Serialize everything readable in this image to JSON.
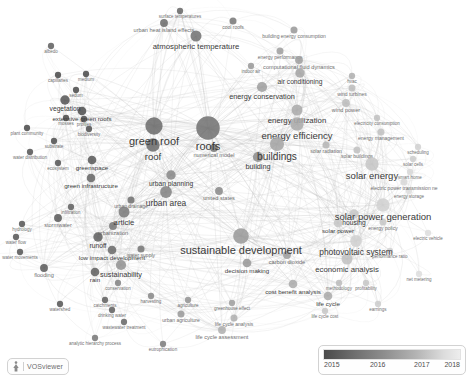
{
  "app": {
    "name": "VOSviewer",
    "logo_mark": "vosviewer-mark"
  },
  "legend": {
    "title": "year-overlay-scale",
    "ticks": [
      "2015",
      "2016",
      "2017",
      "2018"
    ],
    "color_start": "#4a4a4a",
    "color_end": "#ededed"
  },
  "chart_data": {
    "type": "network",
    "title": "",
    "colormap": "grayscale-by-average-publication-year",
    "color_range": [
      2015,
      2018
    ],
    "nodes": [
      {
        "label": "roofs",
        "x": 208,
        "y": 128,
        "size": 30,
        "year": 2015.9
      },
      {
        "label": "green roof",
        "x": 154,
        "y": 126,
        "size": 22,
        "year": 2015.8
      },
      {
        "label": "roof",
        "x": 153,
        "y": 145,
        "size": 17,
        "year": 2015.8
      },
      {
        "label": "buildings",
        "x": 277,
        "y": 144,
        "size": 18,
        "year": 2016.8
      },
      {
        "label": "building",
        "x": 258,
        "y": 157,
        "size": 13,
        "year": 2016.4
      },
      {
        "label": "sustainable development",
        "x": 241,
        "y": 236,
        "size": 20,
        "year": 2016.6
      },
      {
        "label": "energy efficiency",
        "x": 297,
        "y": 124,
        "size": 17,
        "year": 2016.9
      },
      {
        "label": "energy utilization",
        "x": 297,
        "y": 110,
        "size": 14,
        "year": 2016.9
      },
      {
        "label": "solar energy",
        "x": 372,
        "y": 164,
        "size": 17,
        "year": 2017.4
      },
      {
        "label": "solar power generation",
        "x": 383,
        "y": 205,
        "size": 17,
        "year": 2017.6
      },
      {
        "label": "photovoltaic system",
        "x": 356,
        "y": 241,
        "size": 15,
        "year": 2017.6
      },
      {
        "label": "economic analysis",
        "x": 347,
        "y": 259,
        "size": 14,
        "year": 2017.3
      },
      {
        "label": "urban area",
        "x": 166,
        "y": 192,
        "size": 15,
        "year": 2016.2
      },
      {
        "label": "urban planning",
        "x": 171,
        "y": 175,
        "size": 12,
        "year": 2016.3
      },
      {
        "label": "article",
        "x": 124,
        "y": 212,
        "size": 14,
        "year": 2016.1
      },
      {
        "label": "atmospheric temperature",
        "x": 196,
        "y": 36,
        "size": 14,
        "year": 2015.9
      },
      {
        "label": "sustainability",
        "x": 121,
        "y": 265,
        "size": 13,
        "year": 2016.5
      },
      {
        "label": "runoff",
        "x": 98,
        "y": 237,
        "size": 12,
        "year": 2015.6
      },
      {
        "label": "low impact development",
        "x": 112,
        "y": 250,
        "size": 11,
        "year": 2015.8
      },
      {
        "label": "rain",
        "x": 95,
        "y": 272,
        "size": 11,
        "year": 2015.6
      },
      {
        "label": "vegetation",
        "x": 65,
        "y": 100,
        "size": 12,
        "year": 2015.4
      },
      {
        "label": "extensive green roofs",
        "x": 82,
        "y": 111,
        "size": 11,
        "year": 2015.3
      },
      {
        "label": "greenspace",
        "x": 92,
        "y": 160,
        "size": 11,
        "year": 2015.5
      },
      {
        "label": "green infrastructure",
        "x": 91,
        "y": 178,
        "size": 11,
        "year": 2015.7
      },
      {
        "label": "housing",
        "x": 354,
        "y": 214,
        "size": 12,
        "year": 2017.4
      },
      {
        "label": "solar power",
        "x": 338,
        "y": 223,
        "size": 11,
        "year": 2017.4
      },
      {
        "label": "cost benefit analysis",
        "x": 293,
        "y": 284,
        "size": 11,
        "year": 2016.9
      },
      {
        "label": "decision making",
        "x": 247,
        "y": 263,
        "size": 11,
        "year": 2016.6
      },
      {
        "label": "life cycle",
        "x": 328,
        "y": 296,
        "size": 11,
        "year": 2016.9
      },
      {
        "label": "air conditioning",
        "x": 300,
        "y": 73,
        "size": 12,
        "year": 2016.8
      },
      {
        "label": "energy conservation",
        "x": 262,
        "y": 87,
        "size": 13,
        "year": 2016.7
      },
      {
        "label": "numerical model",
        "x": 214,
        "y": 148,
        "size": 10,
        "year": 2016.0
      },
      {
        "label": "urbanization",
        "x": 113,
        "y": 226,
        "size": 10,
        "year": 2016.0
      },
      {
        "label": "stormwater",
        "x": 58,
        "y": 218,
        "size": 10,
        "year": 2015.5
      },
      {
        "label": "flooding",
        "x": 44,
        "y": 268,
        "size": 10,
        "year": 2015.5
      },
      {
        "label": "watershed",
        "x": 60,
        "y": 304,
        "size": 8,
        "year": 2015.4
      },
      {
        "label": "catchments",
        "x": 105,
        "y": 300,
        "size": 8,
        "year": 2015.6
      },
      {
        "label": "drinking water",
        "x": 112,
        "y": 310,
        "size": 8,
        "year": 2015.6
      },
      {
        "label": "wastewater treatment",
        "x": 124,
        "y": 322,
        "size": 8,
        "year": 2015.7
      },
      {
        "label": "analytic hierarchy process",
        "x": 95,
        "y": 338,
        "size": 8,
        "year": 2016.0
      },
      {
        "label": "eutrophication",
        "x": 163,
        "y": 344,
        "size": 8,
        "year": 2016.1
      },
      {
        "label": "life cycle assessment",
        "x": 222,
        "y": 330,
        "size": 10,
        "year": 2017.0
      },
      {
        "label": "life cycle analysis",
        "x": 234,
        "y": 318,
        "size": 9,
        "year": 2017.0
      },
      {
        "label": "urban agriculture",
        "x": 181,
        "y": 314,
        "size": 9,
        "year": 2016.6
      },
      {
        "label": "agriculture",
        "x": 188,
        "y": 300,
        "size": 8,
        "year": 2016.5
      },
      {
        "label": "harvesting",
        "x": 151,
        "y": 296,
        "size": 8,
        "year": 2016.3
      },
      {
        "label": "conservation",
        "x": 118,
        "y": 283,
        "size": 8,
        "year": 2016.2
      },
      {
        "label": "greenhouse effect",
        "x": 232,
        "y": 303,
        "size": 8,
        "year": 2016.7
      },
      {
        "label": "carbon dioxide",
        "x": 287,
        "y": 255,
        "size": 10,
        "year": 2016.7
      },
      {
        "label": "surface temperatures",
        "x": 180,
        "y": 11,
        "size": 8,
        "year": 2015.7
      },
      {
        "label": "urban heat island effects",
        "x": 164,
        "y": 23,
        "size": 10,
        "year": 2015.8
      },
      {
        "label": "cool roofs",
        "x": 233,
        "y": 21,
        "size": 9,
        "year": 2016.0
      },
      {
        "label": "albedo",
        "x": 51,
        "y": 46,
        "size": 8,
        "year": 2015.6
      },
      {
        "label": "building energy consumption",
        "x": 294,
        "y": 30,
        "size": 9,
        "year": 2016.6
      },
      {
        "label": "energy performance",
        "x": 280,
        "y": 51,
        "size": 9,
        "year": 2016.7
      },
      {
        "label": "computational fluid dynamics",
        "x": 299,
        "y": 60,
        "size": 10,
        "year": 2016.7
      },
      {
        "label": "hvac",
        "x": 352,
        "y": 76,
        "size": 8,
        "year": 2017.0
      },
      {
        "label": "wind turbines",
        "x": 352,
        "y": 88,
        "size": 9,
        "year": 2017.2
      },
      {
        "label": "wind power",
        "x": 346,
        "y": 103,
        "size": 10,
        "year": 2017.2
      },
      {
        "label": "electricity consumption",
        "x": 377,
        "y": 118,
        "size": 8,
        "year": 2017.3
      },
      {
        "label": "energy management",
        "x": 381,
        "y": 132,
        "size": 9,
        "year": 2017.3
      },
      {
        "label": "solar buildings",
        "x": 357,
        "y": 150,
        "size": 9,
        "year": 2017.3
      },
      {
        "label": "scheduling",
        "x": 418,
        "y": 147,
        "size": 8,
        "year": 2017.6
      },
      {
        "label": "solar cells",
        "x": 413,
        "y": 159,
        "size": 8,
        "year": 2017.5
      },
      {
        "label": "smart home",
        "x": 410,
        "y": 172,
        "size": 8,
        "year": 2017.7
      },
      {
        "label": "electric power transmission ne",
        "x": 404,
        "y": 182,
        "size": 9,
        "year": 2017.7
      },
      {
        "label": "energy storage",
        "x": 409,
        "y": 191,
        "size": 8,
        "year": 2017.8
      },
      {
        "label": "energy policy",
        "x": 383,
        "y": 222,
        "size": 9,
        "year": 2017.4
      },
      {
        "label": "electric vehicle",
        "x": 428,
        "y": 233,
        "size": 8,
        "year": 2017.8
      },
      {
        "label": "performance ratio",
        "x": 390,
        "y": 251,
        "size": 8,
        "year": 2017.6
      },
      {
        "label": "net metering",
        "x": 419,
        "y": 274,
        "size": 8,
        "year": 2017.8
      },
      {
        "label": "profitability",
        "x": 366,
        "y": 283,
        "size": 8,
        "year": 2017.4
      },
      {
        "label": "methodology",
        "x": 339,
        "y": 283,
        "size": 8,
        "year": 2017.2
      },
      {
        "label": "earnings",
        "x": 378,
        "y": 304,
        "size": 8,
        "year": 2017.5
      },
      {
        "label": "life cycle cost",
        "x": 325,
        "y": 311,
        "size": 8,
        "year": 2017.4
      },
      {
        "label": "united states",
        "x": 219,
        "y": 191,
        "size": 10,
        "year": 2016.3
      },
      {
        "label": "plant community",
        "x": 27,
        "y": 128,
        "size": 8,
        "year": 2015.2
      },
      {
        "label": "water distribution",
        "x": 30,
        "y": 152,
        "size": 8,
        "year": 2015.4
      },
      {
        "label": "capillaries",
        "x": 58,
        "y": 75,
        "size": 8,
        "year": 2015.2
      },
      {
        "label": "medium",
        "x": 86,
        "y": 74,
        "size": 8,
        "year": 2015.2
      },
      {
        "label": "sedum",
        "x": 76,
        "y": 90,
        "size": 8,
        "year": 2015.2
      },
      {
        "label": "substrate",
        "x": 54,
        "y": 141,
        "size": 8,
        "year": 2015.3
      },
      {
        "label": "biodiversity",
        "x": 89,
        "y": 129,
        "size": 8,
        "year": 2015.3
      },
      {
        "label": "ecosystem",
        "x": 58,
        "y": 163,
        "size": 8,
        "year": 2015.4
      },
      {
        "label": "hydrology",
        "x": 22,
        "y": 224,
        "size": 8,
        "year": 2015.4
      },
      {
        "label": "water flow",
        "x": 16,
        "y": 237,
        "size": 8,
        "year": 2015.4
      },
      {
        "label": "water movements",
        "x": 20,
        "y": 252,
        "size": 8,
        "year": 2015.4
      },
      {
        "label": "water supply",
        "x": 141,
        "y": 249,
        "size": 9,
        "year": 2016.0
      },
      {
        "label": "urban drainage",
        "x": 131,
        "y": 200,
        "size": 9,
        "year": 2015.9
      },
      {
        "label": "infiltration",
        "x": 71,
        "y": 207,
        "size": 8,
        "year": 2015.6
      },
      {
        "label": "mosses",
        "x": 66,
        "y": 118,
        "size": 8,
        "year": 2015.2
      },
      {
        "label": "profiles",
        "x": 84,
        "y": 119,
        "size": 8,
        "year": 2015.3
      },
      {
        "label": "indoor air",
        "x": 251,
        "y": 66,
        "size": 8,
        "year": 2016.6
      },
      {
        "label": "solar radiation",
        "x": 326,
        "y": 145,
        "size": 9,
        "year": 2017.1
      }
    ],
    "edges_style": {
      "color": "#b9b9b9",
      "opacity": 0.45,
      "count_approx": 900
    }
  }
}
